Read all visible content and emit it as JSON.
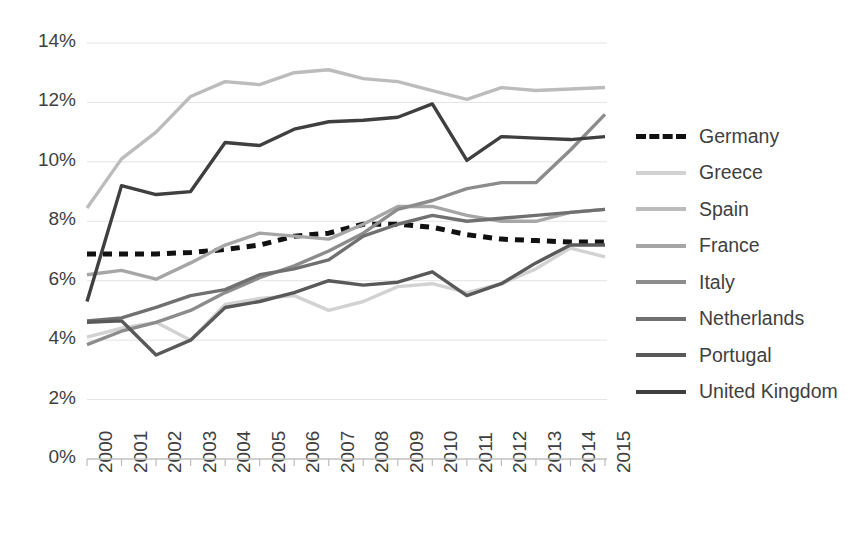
{
  "chart_data": {
    "type": "line",
    "title": "",
    "subtitle": "",
    "xlabel": "",
    "ylabel": "",
    "x": [
      "2000",
      "2001",
      "2002",
      "2003",
      "2004",
      "2005",
      "2006",
      "2007",
      "2008",
      "2009",
      "2010",
      "2011",
      "2012",
      "2013",
      "2014",
      "2015"
    ],
    "xlim": [
      "2000",
      "2015"
    ],
    "ylim": [
      0,
      14
    ],
    "yticks": [
      "0%",
      "2%",
      "4%",
      "6%",
      "8%",
      "10%",
      "12%",
      "14%"
    ],
    "ytick_values": [
      0,
      2,
      4,
      6,
      8,
      10,
      12,
      14
    ],
    "grid": true,
    "legend_position": "right",
    "series": [
      {
        "name": "Germany",
        "color": "#111111",
        "style": "dashed",
        "values": [
          6.9,
          6.9,
          6.9,
          6.95,
          7.05,
          7.2,
          7.5,
          7.6,
          7.9,
          7.9,
          7.8,
          7.55,
          7.4,
          7.35,
          7.3,
          7.3
        ]
      },
      {
        "name": "Greece",
        "color": "#d2d2d2",
        "style": "solid",
        "values": [
          4.1,
          4.4,
          4.6,
          4.0,
          5.2,
          5.4,
          5.5,
          5.0,
          5.3,
          5.8,
          5.9,
          5.6,
          5.9,
          6.4,
          7.1,
          6.8
        ]
      },
      {
        "name": "Spain",
        "color": "#bcbcbc",
        "style": "solid",
        "values": [
          8.45,
          10.1,
          11.0,
          12.2,
          12.7,
          12.6,
          13.0,
          13.1,
          12.8,
          12.7,
          12.4,
          12.1,
          12.5,
          12.4,
          12.45,
          12.5
        ]
      },
      {
        "name": "France",
        "color": "#a6a6a6",
        "style": "solid",
        "values": [
          6.2,
          6.35,
          6.05,
          6.6,
          7.2,
          7.6,
          7.5,
          7.4,
          7.9,
          8.5,
          8.5,
          8.2,
          8.0,
          8.0,
          8.3,
          8.4
        ]
      },
      {
        "name": "Italy",
        "color": "#8c8c8c",
        "style": "solid",
        "values": [
          3.85,
          4.3,
          4.6,
          5.0,
          5.6,
          6.1,
          6.5,
          7.0,
          7.6,
          8.4,
          8.7,
          9.1,
          9.3,
          9.3,
          10.4,
          11.6
        ]
      },
      {
        "name": "Netherlands",
        "color": "#707070",
        "style": "solid",
        "values": [
          4.65,
          4.75,
          5.1,
          5.5,
          5.7,
          6.2,
          6.4,
          6.7,
          7.5,
          7.9,
          8.2,
          8.0,
          8.1,
          8.2,
          8.3,
          8.4
        ]
      },
      {
        "name": "Portugal",
        "color": "#595959",
        "style": "solid",
        "values": [
          4.6,
          4.65,
          3.5,
          4.0,
          5.1,
          5.3,
          5.6,
          6.0,
          5.85,
          5.95,
          6.3,
          5.5,
          5.9,
          6.6,
          7.2,
          7.2
        ]
      },
      {
        "name": "United Kingdom",
        "color": "#3f3f3f",
        "style": "solid",
        "values": [
          5.3,
          9.2,
          8.9,
          9.0,
          10.65,
          10.55,
          11.1,
          11.35,
          11.4,
          11.5,
          11.95,
          10.05,
          10.85,
          10.8,
          10.75,
          10.85
        ]
      }
    ]
  },
  "legend": {
    "items": [
      {
        "label": "Germany"
      },
      {
        "label": "Greece"
      },
      {
        "label": "Spain"
      },
      {
        "label": "France"
      },
      {
        "label": "Italy"
      },
      {
        "label": "Netherlands"
      },
      {
        "label": "Portugal"
      },
      {
        "label": "United Kingdom"
      }
    ]
  }
}
